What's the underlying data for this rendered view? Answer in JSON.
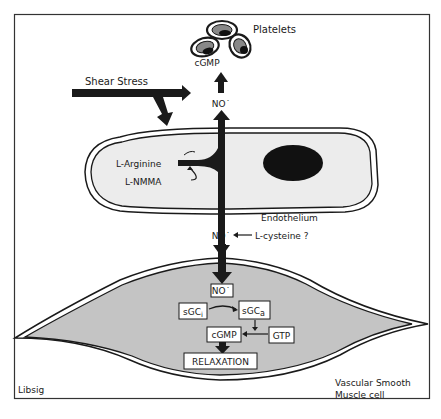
{
  "figure": {
    "credit": "Libsig",
    "colors": {
      "ink": "#1a1a1a",
      "endothelium_fill": "#ececec",
      "smooth_muscle_fill": "#c4c4c4",
      "nucleus": "#111111",
      "background": "#ffffff"
    }
  },
  "platelets": {
    "label": "Platelets",
    "messenger": "cGMP"
  },
  "shear": {
    "label": "Shear Stress"
  },
  "endothelium": {
    "label": "Endothelium",
    "substrate": "L-Arginine",
    "inhibitor": "L-NMMA",
    "no_upper": "NO˙",
    "no_lower": "NO˙",
    "carrier": "L-cysteine ?"
  },
  "smooth_muscle": {
    "label_line1": "Vascular Smooth",
    "label_line2": "Muscle cell",
    "no_inside": "NO˙",
    "sgc_inactive_base": "sGC",
    "sgc_inactive_sub": "i",
    "sgc_active_base": "sGC",
    "sgc_active_sub": "a",
    "gtp": "GTP",
    "cgmp": "cGMP",
    "relaxation": "RELAXATION"
  }
}
